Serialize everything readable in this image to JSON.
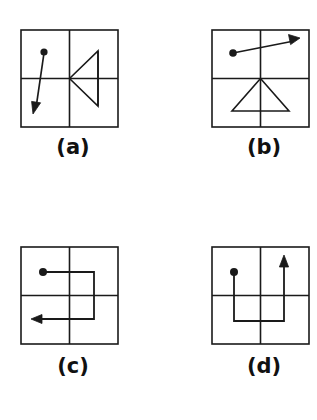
{
  "figure": {
    "background_color": "#ffffff",
    "stroke_color": "#1a1a1a",
    "panel_count": 4,
    "panels": [
      {
        "id": "a",
        "label": "(a)",
        "description": "Square frame with center crosshair; filled dot in upper-left quadrant; straight arrow from the dot through the center continuing to the lower-left with an arrowhead; open triangle with apex at the center opening to the right.",
        "dot_quadrant": "upper-left",
        "arrow_direction": "down-left",
        "shape": "triangle-opening-right"
      },
      {
        "id": "b",
        "label": "(b)",
        "description": "Square frame with center crosshair; filled dot in upper-left quadrant; straight arrow from the dot through the center continuing to the upper-right with an arrowhead; open triangle with apex at the center opening downward with a horizontal base in the lower half.",
        "dot_quadrant": "upper-left",
        "arrow_direction": "up-right",
        "shape": "triangle-opening-down"
      },
      {
        "id": "c",
        "label": "(c)",
        "description": "Square frame with center crosshair; filled dot in upper-left quadrant; orthogonal path going right, then down, then left, ending with an arrowhead pointing left in the lower-left quadrant.",
        "dot_quadrant": "upper-left",
        "arrow_direction": "left",
        "shape": "staircase-path-right-down-left"
      },
      {
        "id": "d",
        "label": "(d)",
        "description": "Square frame with center crosshair; filled dot in upper-left quadrant; orthogonal path going down, then right, then up, ending with an arrowhead pointing up in the upper-right quadrant.",
        "dot_quadrant": "upper-left",
        "arrow_direction": "up",
        "shape": "staircase-path-down-right-up"
      }
    ]
  }
}
